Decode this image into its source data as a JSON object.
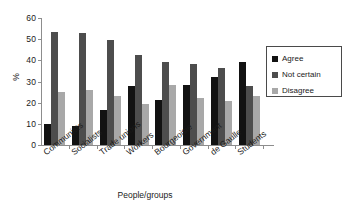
{
  "chart_data": {
    "type": "bar",
    "title": "",
    "xlabel": "People/groups",
    "ylabel": "%",
    "ylim": [
      0,
      60
    ],
    "yticks": [
      0,
      10,
      20,
      30,
      40,
      50,
      60
    ],
    "grid": false,
    "legend_position": "right",
    "categories": [
      "Communists",
      "Socialists",
      "Trade unions",
      "Workers",
      "Bourgeoisie",
      "Government",
      "de Gaulle",
      "Students"
    ],
    "series": [
      {
        "name": "Agree",
        "color": "#121212",
        "values": [
          10,
          9,
          16.5,
          28,
          21.5,
          28.5,
          32,
          39
        ]
      },
      {
        "name": "Not certain",
        "color": "#4d4d4d",
        "values": [
          53.5,
          53,
          49.5,
          42.5,
          39,
          38.5,
          36.5,
          28
        ]
      },
      {
        "name": "Disagree",
        "color": "#a8a8a8",
        "values": [
          25,
          26,
          23,
          19.5,
          28.5,
          22,
          21,
          23
        ]
      }
    ]
  },
  "legend": {
    "items": [
      {
        "label": "Agree",
        "swatch": "agree"
      },
      {
        "label": "Not certain",
        "swatch": "notcertain"
      },
      {
        "label": "Disagree",
        "swatch": "disagree"
      }
    ]
  }
}
